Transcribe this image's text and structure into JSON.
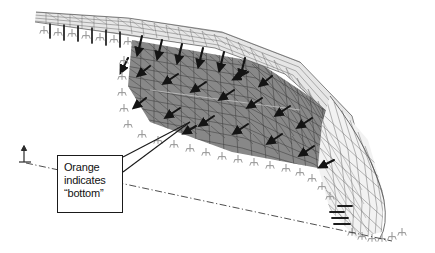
{
  "figure": {
    "kind": "finite-element-shell-mesh-diagram",
    "background_color": "#ffffff"
  },
  "callout": {
    "lines": [
      "Orange",
      "indicates",
      "“bottom”"
    ],
    "line1": "Orange",
    "line2": "indicates",
    "line3": "“bottom”",
    "border_color": "#1a1a1a",
    "fill_color": "#ffffff",
    "text_color": "#111111"
  },
  "leader": {
    "target_x": 190,
    "target_y": 122,
    "count": 2,
    "color": "#1a1a1a"
  },
  "centerline": {
    "style": "dash-dot",
    "color": "#3a3a3a",
    "from_x": 26,
    "from_y": 163,
    "to_x": 392,
    "to_y": 241
  },
  "axis_symbol": {
    "name": "vertical-axis-indicator",
    "x": 24,
    "y": 148,
    "color": "#2b2b2b"
  },
  "shell": {
    "bottom_surface_color": "#8a8a8a",
    "top_surface_color": "#e8e8e8",
    "mesh_line_color": "#3b3b3b",
    "load_arrow_color": "#141414",
    "support_symbol_color": "#9d9d9d",
    "load_arrow_count": 24,
    "support_symbol_count": 34
  }
}
